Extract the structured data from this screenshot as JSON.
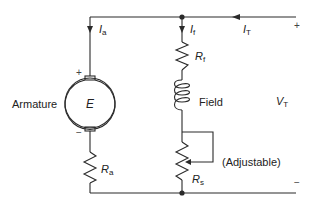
{
  "diagram": {
    "colors": {
      "wire": "#2a2a2a",
      "text": "#222222",
      "background": "#ffffff"
    },
    "components": {
      "armature": {
        "label": "Armature",
        "emf_symbol": "E",
        "plus": "+",
        "minus": "−"
      },
      "armature_resistor": {
        "symbol": "R",
        "subscript": "a"
      },
      "field_resistor": {
        "symbol": "R",
        "subscript": "f"
      },
      "field_coil": {
        "label": "Field"
      },
      "series_resistor": {
        "symbol": "R",
        "subscript": "s",
        "note": "(Adjustable)"
      }
    },
    "currents": {
      "armature": {
        "symbol": "I",
        "subscript": "a"
      },
      "field": {
        "symbol": "I",
        "subscript": "f"
      },
      "terminal": {
        "symbol": "I",
        "subscript": "T"
      }
    },
    "terminal_voltage": {
      "symbol": "V",
      "subscript": "T",
      "plus": "+",
      "minus": "−"
    }
  }
}
